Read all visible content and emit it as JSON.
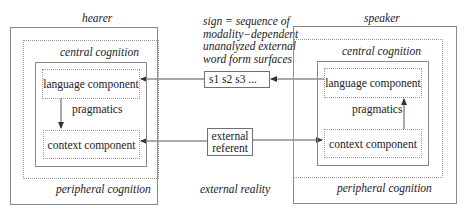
{
  "hearer": {
    "title": "hearer",
    "central_label": "central cognition",
    "peripheral_label": "peripheral cognition",
    "language_component": "language component",
    "pragmatics": "pragmatics",
    "context_component": "context component"
  },
  "speaker": {
    "title": "speaker",
    "central_label": "central cognition",
    "peripheral_label": "peripheral cognition",
    "language_component": "language component",
    "pragmatics": "pragmatics",
    "context_component": "context component"
  },
  "middle": {
    "sign_caption": [
      "sign = sequence of",
      "modality−dependent",
      "unanalyzed external",
      "word form surfaces"
    ],
    "sign_box": "s1 s2 s3 ...",
    "referent_box": [
      "external",
      "referent"
    ],
    "external_reality": "external reality"
  },
  "arrows": [
    {
      "from": "speaker.language_component",
      "to": "sign_box",
      "direction": "left"
    },
    {
      "from": "sign_box",
      "to": "hearer.language_component",
      "direction": "left"
    },
    {
      "from": "hearer.language_component",
      "to": "hearer.context_component",
      "direction": "down",
      "label": "pragmatics"
    },
    {
      "from": "speaker.context_component",
      "to": "speaker.language_component",
      "direction": "up",
      "label": "pragmatics"
    },
    {
      "from": "external_referent",
      "to": "hearer.context_component",
      "direction": "left"
    },
    {
      "from": "external_referent",
      "to": "speaker.context_component",
      "direction": "right"
    }
  ],
  "colors": {
    "line": "#555555",
    "box_border": "#8a8a8a",
    "dotted_border": "#9a9a9a",
    "text": "#222222"
  }
}
